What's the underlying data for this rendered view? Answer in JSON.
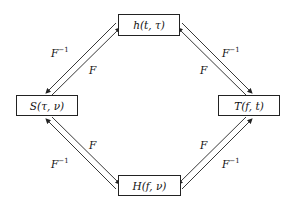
{
  "nodes": {
    "top": "h(t, τ)",
    "left": "S(τ, ν)",
    "right": "T(f, t)",
    "bottom": "H(f, ν)"
  },
  "edges": {
    "top_left_outer": {
      "base": "F",
      "sup": "−1"
    },
    "top_left_inner": {
      "base": "F",
      "sup": ""
    },
    "top_right_outer": {
      "base": "F",
      "sup": "−1"
    },
    "bottom_left_inner": {
      "base": "F",
      "sup": ""
    },
    "bottom_left_outer": {
      "base": "F",
      "sup": "−1"
    },
    "bottom_right_inner": {
      "base": "F",
      "sup": ""
    },
    "bottom_right_outer": {
      "base": "F",
      "sup": "−1"
    }
  }
}
